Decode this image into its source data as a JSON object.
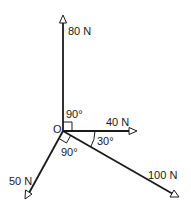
{
  "diagram": {
    "type": "force-diagram",
    "origin_label": "O",
    "forces": [
      {
        "label": "80 N",
        "direction": "up"
      },
      {
        "label": "40 N",
        "direction": "right"
      },
      {
        "label": "100 N",
        "direction": "down-right"
      },
      {
        "label": "50 N",
        "direction": "down-left"
      }
    ],
    "angles": [
      {
        "label": "90°",
        "between": "80 N and 40 N"
      },
      {
        "label": "30°",
        "between": "40 N and 100 N"
      },
      {
        "label": "90°",
        "between": "100 N and 50 N"
      }
    ],
    "colors": {
      "line": "#1a1a1a",
      "background": "#ffffff"
    }
  }
}
